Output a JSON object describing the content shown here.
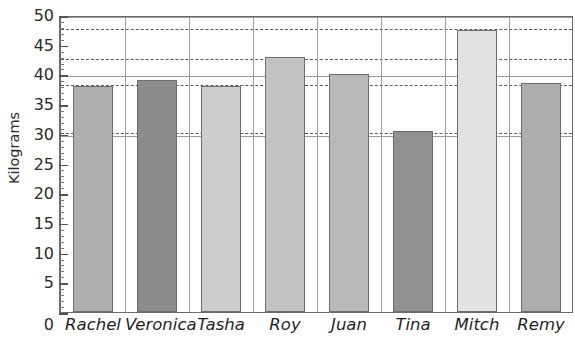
{
  "chart_data": {
    "type": "bar",
    "title": "",
    "xlabel": "",
    "ylabel": "Kilograms",
    "categories": [
      "Rachel",
      "Veronica",
      "Tasha",
      "Roy",
      "Juan",
      "Tina",
      "Mitch",
      "Remy"
    ],
    "values": [
      38,
      39,
      38,
      43,
      40,
      30.5,
      47.5,
      38.5
    ],
    "ylim": [
      0,
      50
    ],
    "y_tick_step": 5,
    "y_minor_tick_step": 1,
    "y_tick_labels": [
      "50",
      "45",
      "40",
      "35",
      "30",
      "25",
      "20",
      "15",
      "10",
      "5",
      "0"
    ],
    "grid": {
      "solid_horizontal_at": [
        30,
        40,
        50
      ],
      "dashed_horizontal_at": [
        30.5,
        38.5,
        43,
        48
      ],
      "vertical_dividers": true
    },
    "legend": null,
    "bar_colors": [
      "#aeaeae",
      "#8b8b8b",
      "#cdcdcd",
      "#c2c2c2",
      "#b9b9b9",
      "#919191",
      "#e2e2e2",
      "#adadad"
    ]
  },
  "axis": {
    "y_title": "Kilograms",
    "zero_label": "0"
  },
  "colors": {
    "bar_medium": "#aeaeae",
    "bar_dark": "#8b8b8b",
    "bar_light": "#e2e2e2",
    "axis": "#6b6b6b",
    "gridline_solid": "#9a9a9a",
    "gridline_dashed": "#5a5a5a",
    "text": "#1f1f1f"
  }
}
